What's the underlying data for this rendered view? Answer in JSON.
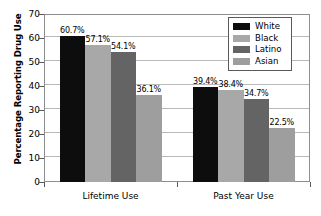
{
  "chart_data": {
    "type": "bar",
    "title": "",
    "subtitle": "",
    "xlabel": "",
    "ylabel": "Percentage Reporting Drug Use",
    "categories": [
      "Lifetime Use",
      "Past Year Use"
    ],
    "series": [
      {
        "name": "White",
        "values": [
          60.7,
          39.4
        ],
        "labels": [
          "60.7%",
          "39.4%"
        ],
        "color": "#0d0d0d"
      },
      {
        "name": "Black",
        "values": [
          57.1,
          38.4
        ],
        "labels": [
          "57.1%",
          "38.4%"
        ],
        "color": "#a8a8a8"
      },
      {
        "name": "Latino",
        "values": [
          54.1,
          34.7
        ],
        "labels": [
          "54.1%",
          "34.7%"
        ],
        "color": "#646464"
      },
      {
        "name": "Asian",
        "values": [
          36.1,
          22.5
        ],
        "labels": [
          "36.1%",
          "22.5%"
        ],
        "color": "#9e9e9e"
      }
    ],
    "ylim": [
      0,
      70
    ],
    "yticks": [
      0,
      10,
      20,
      30,
      40,
      50,
      60,
      70
    ],
    "ytick_labels": [
      "0",
      "10",
      "20",
      "30",
      "40",
      "50",
      "60",
      "70"
    ],
    "grid": true,
    "grid_axis": "y",
    "legend_position": "top-right",
    "legend_entries": [
      "White",
      "Black",
      "Latino",
      "Asian"
    ]
  },
  "axis": {
    "y_title": "Percentage Reporting Drug Use"
  },
  "legend": {
    "items": [
      {
        "label": "White"
      },
      {
        "label": "Black"
      },
      {
        "label": "Latino"
      },
      {
        "label": "Asian"
      }
    ]
  }
}
